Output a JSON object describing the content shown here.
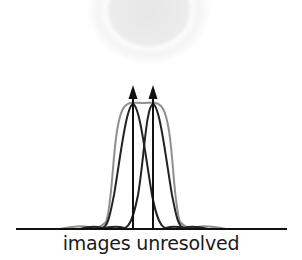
{
  "caption": "images unresolved",
  "colors": {
    "background": "#ffffff",
    "airy_disk": "#e8e8e8",
    "individual_curves": "#1f1f1f",
    "combined_curve": "#8a8a8a",
    "arrows": "#111111",
    "baseline": "#111111"
  },
  "diagram": {
    "type": "rayleigh-criterion-unresolved",
    "point_sources": [
      {
        "x": 133,
        "label": ""
      },
      {
        "x": 153,
        "label": ""
      }
    ],
    "baseline": {
      "y": 229,
      "x1": 16,
      "x2": 287
    },
    "peak_y": 104,
    "arrow_tip_y": 86,
    "airy_disk": {
      "cx": 149,
      "cy": 12,
      "r": 55
    }
  }
}
